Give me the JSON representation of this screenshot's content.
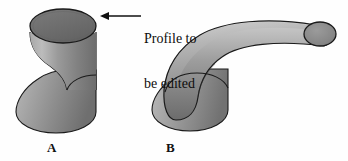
{
  "figure": {
    "background_color": "#fefefe",
    "annotation": {
      "line1": "Profile to",
      "line2": "be edited",
      "text_color": "#0d0d0d",
      "arrow": {
        "name": "leader-arrow",
        "direction": "left",
        "from_x": 141,
        "from_y": 16,
        "to_x": 101,
        "to_y": 16,
        "color": "#101010"
      }
    },
    "shapes": [
      {
        "id": "A",
        "label": "A",
        "label_x": 47,
        "label_y": 140,
        "description": "Vertical lofted solid with editable top profile",
        "outline_color": "#1a1a1a",
        "body_light": "#b4b4b4",
        "body_mid": "#8d8d8d",
        "body_dark": "#6a6a6a",
        "profile_face_color": "#6e6e6e",
        "profile_face_highlight": "#7d7d7d",
        "bounds": {
          "x": 14,
          "y": 8,
          "width": 90,
          "height": 128
        }
      },
      {
        "id": "B",
        "label": "B",
        "label_x": 166,
        "label_y": 140,
        "description": "Same base swept along a curved path into a bent tube",
        "outline_color": "#1a1a1a",
        "body_light": "#bdbdbd",
        "body_mid": "#909090",
        "body_dark": "#6d6d6d",
        "cap_face_color": "#8a8a8a",
        "bounds": {
          "x": 150,
          "y": 16,
          "width": 186,
          "height": 120
        }
      }
    ],
    "colors": {
      "outline": "#1a1a1a",
      "gray_light": "#c2c2c2",
      "gray_mid": "#8d8d8d",
      "gray_dark": "#666666",
      "text": "#0d0d0d"
    }
  }
}
